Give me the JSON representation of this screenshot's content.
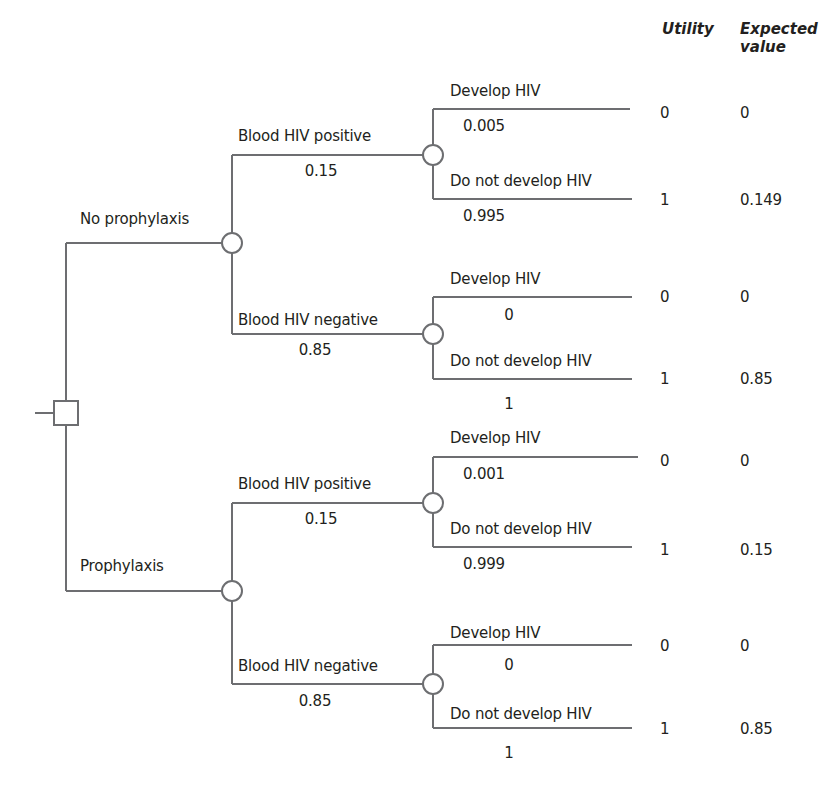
{
  "header": {
    "utility": "Utility",
    "expected_value_line1": "Expected",
    "expected_value_line2": "value"
  },
  "colors": {
    "line": "#6d6e71",
    "text": "#231f20",
    "background": "#ffffff"
  },
  "root": {
    "type": "decision-node",
    "shape": "square"
  },
  "strategies": [
    {
      "label": "No prophylaxis",
      "branches": [
        {
          "label": "Blood HIV positive",
          "prob": "0.15",
          "outcomes": [
            {
              "label": "Develop HIV",
              "prob": "0.005",
              "utility": "0",
              "expected": "0"
            },
            {
              "label": "Do not develop HIV",
              "prob": "0.995",
              "utility": "1",
              "expected": "0.149"
            }
          ]
        },
        {
          "label": "Blood HIV negative",
          "prob": "0.85",
          "outcomes": [
            {
              "label": "Develop HIV",
              "prob": "0",
              "utility": "0",
              "expected": "0"
            },
            {
              "label": "Do not develop HIV",
              "prob": "1",
              "utility": "1",
              "expected": "0.85"
            }
          ]
        }
      ]
    },
    {
      "label": "Prophylaxis",
      "branches": [
        {
          "label": "Blood HIV positive",
          "prob": "0.15",
          "outcomes": [
            {
              "label": "Develop HIV",
              "prob": "0.001",
              "utility": "0",
              "expected": "0"
            },
            {
              "label": "Do not develop HIV",
              "prob": "0.999",
              "utility": "1",
              "expected": "0.15"
            }
          ]
        },
        {
          "label": "Blood HIV negative",
          "prob": "0.85",
          "outcomes": [
            {
              "label": "Develop HIV",
              "prob": "0",
              "utility": "0",
              "expected": "0"
            },
            {
              "label": "Do not develop HIV",
              "prob": "1",
              "utility": "1",
              "expected": "0.85"
            }
          ]
        }
      ]
    }
  ]
}
